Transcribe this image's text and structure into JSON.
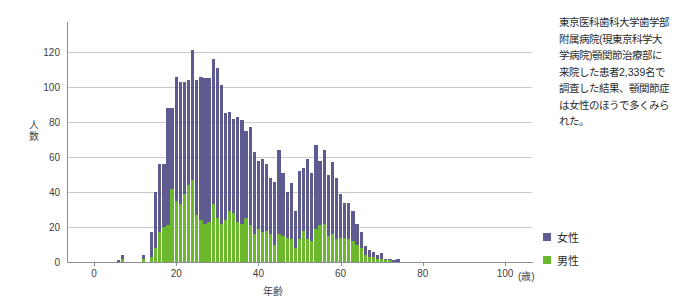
{
  "caption": {
    "lines": [
      "東京医科歯科大学歯学部",
      "附属病院(現東京科学大",
      "学病院)顎関節治療部に",
      "来院した患者2,339名で",
      "調査した結果、顎関節症",
      "は女性のほうで多くみら",
      "れた。"
    ]
  },
  "legend": {
    "position": "right",
    "entries": [
      {
        "label": "女性",
        "color": "#5d5b8f"
      },
      {
        "label": "男性",
        "color": "#6cb82d"
      }
    ]
  },
  "chart_data": {
    "type": "bar",
    "stacked": true,
    "title": "",
    "subtitle": "",
    "xlabel": "年齢",
    "ylabel": "人数",
    "x_unit": "(歳)",
    "xlim": [
      -4,
      104
    ],
    "ylim": [
      0,
      132
    ],
    "xticks": [
      0,
      20,
      40,
      60,
      80,
      100
    ],
    "yticks": [
      0,
      20,
      40,
      60,
      80,
      100,
      120
    ],
    "grid": "horizontal",
    "total_n": "2,339",
    "x": [
      5,
      6,
      7,
      8,
      9,
      10,
      11,
      12,
      13,
      14,
      15,
      16,
      17,
      18,
      19,
      20,
      21,
      22,
      23,
      24,
      25,
      26,
      27,
      28,
      29,
      30,
      31,
      32,
      33,
      34,
      35,
      36,
      37,
      38,
      39,
      40,
      41,
      42,
      43,
      44,
      45,
      46,
      47,
      48,
      49,
      50,
      51,
      52,
      53,
      54,
      55,
      56,
      57,
      58,
      59,
      60,
      61,
      62,
      63,
      64,
      65,
      66,
      67,
      68,
      69,
      70,
      71,
      72,
      73,
      74,
      75,
      76,
      77,
      78,
      79,
      80,
      81,
      82,
      83,
      84,
      85,
      86,
      87,
      88,
      89,
      90,
      91,
      92
    ],
    "series": [
      {
        "name": "男性",
        "color": "#6cb82d",
        "values": [
          0,
          0,
          2,
          0,
          0,
          0,
          0,
          2,
          0,
          3,
          8,
          17,
          20,
          21,
          42,
          35,
          33,
          39,
          44,
          47,
          27,
          24,
          22,
          23,
          33,
          25,
          22,
          24,
          29,
          28,
          23,
          22,
          25,
          21,
          16,
          19,
          17,
          18,
          16,
          10,
          16,
          15,
          14,
          13,
          8,
          13,
          18,
          13,
          12,
          19,
          21,
          22,
          15,
          16,
          13,
          14,
          14,
          13,
          12,
          10,
          8,
          4,
          3,
          3,
          2,
          2,
          1,
          1,
          0,
          0,
          0,
          0,
          0,
          0,
          0,
          0,
          0,
          0,
          0,
          0,
          0,
          0,
          0,
          0,
          0,
          0,
          0,
          0
        ]
      },
      {
        "name": "女性",
        "color": "#5d5b8f",
        "values": [
          0,
          1,
          2,
          0,
          0,
          0,
          0,
          2,
          0,
          14,
          32,
          39,
          36,
          67,
          46,
          71,
          70,
          64,
          60,
          74,
          77,
          82,
          83,
          82,
          83,
          86,
          79,
          61,
          57,
          54,
          60,
          59,
          50,
          56,
          47,
          39,
          42,
          38,
          32,
          36,
          48,
          36,
          26,
          32,
          21,
          39,
          36,
          46,
          39,
          48,
          37,
          42,
          35,
          41,
          35,
          25,
          20,
          21,
          17,
          12,
          9,
          5,
          4,
          3,
          2,
          3,
          1,
          1,
          1,
          2,
          0,
          0,
          0,
          0,
          0,
          0,
          0,
          0,
          0,
          0,
          0,
          0,
          0,
          0,
          0,
          0,
          0,
          0
        ]
      }
    ],
    "totals": [
      0,
      1,
      4,
      0,
      0,
      0,
      0,
      4,
      0,
      17,
      40,
      56,
      56,
      88,
      88,
      106,
      103,
      103,
      104,
      121,
      104,
      106,
      105,
      105,
      116,
      111,
      101,
      85,
      86,
      82,
      83,
      81,
      75,
      77,
      63,
      58,
      59,
      56,
      48,
      46,
      64,
      51,
      40,
      45,
      29,
      52,
      54,
      59,
      51,
      67,
      58,
      64,
      50,
      57,
      48,
      39,
      34,
      34,
      29,
      22,
      17,
      9,
      7,
      6,
      4,
      5,
      2,
      2,
      1,
      2,
      0,
      0,
      0,
      0,
      0,
      0,
      0,
      0,
      0,
      0,
      0,
      0,
      0,
      0,
      0,
      0,
      0,
      0
    ]
  }
}
